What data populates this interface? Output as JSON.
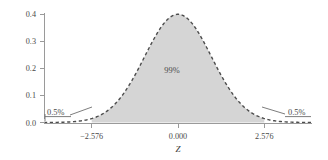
{
  "chart_data": {
    "type": "area",
    "title": "",
    "subtitle": "",
    "xlabel": "Z",
    "ylabel": "",
    "xlim": [
      -4.0,
      4.0
    ],
    "ylim": [
      0.0,
      0.42
    ],
    "grid": false,
    "legend": null,
    "distribution": {
      "name": "standard normal",
      "mean": 0.0,
      "sd": 1.0,
      "peak_density": 0.3989
    },
    "x_ticks": [
      {
        "value": -2.576,
        "label": "−2.576"
      },
      {
        "value": 0.0,
        "label": "0.000"
      },
      {
        "value": 2.576,
        "label": "2.576"
      }
    ],
    "y_ticks": [
      {
        "value": 0.0,
        "label": "0.0"
      },
      {
        "value": 0.1,
        "label": "0.1"
      },
      {
        "value": 0.2,
        "label": "0.2"
      },
      {
        "value": 0.3,
        "label": "0.3"
      },
      {
        "value": 0.4,
        "label": "0.4"
      }
    ],
    "shaded_region": {
      "from": -2.576,
      "to": 2.576,
      "area_label": "99%"
    },
    "annotations": [
      {
        "id": "left-tail",
        "label": "0.5%",
        "region_from": -4.0,
        "region_to": -2.576
      },
      {
        "id": "central",
        "label": "99%",
        "region_from": -2.576,
        "region_to": 2.576
      },
      {
        "id": "right-tail",
        "label": "0.5%",
        "region_from": 2.576,
        "region_to": 4.0
      }
    ],
    "series": [
      {
        "name": "standard normal density",
        "x": [
          -4.0,
          -3.75,
          -3.5,
          -3.25,
          -3.0,
          -2.75,
          -2.576,
          -2.5,
          -2.25,
          -2.0,
          -1.75,
          -1.5,
          -1.25,
          -1.0,
          -0.75,
          -0.5,
          -0.25,
          0.0,
          0.25,
          0.5,
          0.75,
          1.0,
          1.25,
          1.5,
          1.75,
          2.0,
          2.25,
          2.5,
          2.576,
          2.75,
          3.0,
          3.25,
          3.5,
          3.75,
          4.0
        ],
        "values": [
          0.0001,
          0.0004,
          0.0009,
          0.002,
          0.0044,
          0.0091,
          0.0145,
          0.0175,
          0.0317,
          0.054,
          0.0863,
          0.1295,
          0.1826,
          0.242,
          0.3011,
          0.3521,
          0.3867,
          0.3989,
          0.3867,
          0.3521,
          0.3011,
          0.242,
          0.1826,
          0.1295,
          0.0863,
          0.054,
          0.0317,
          0.0175,
          0.0145,
          0.0091,
          0.0044,
          0.002,
          0.0009,
          0.0004,
          0.0001
        ]
      }
    ],
    "colors": {
      "fill": "#d5d5d5",
      "curve": "#4d4d4d",
      "axis": "#9a9a9a",
      "text": "#4a4a4a",
      "background": "#ffffff"
    }
  }
}
